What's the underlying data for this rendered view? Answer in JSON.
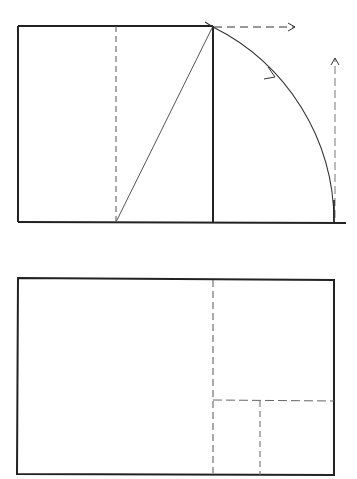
{
  "diagram": {
    "stroke_color": "#222222",
    "dash_color": "#555555",
    "top_figure": {
      "square": {
        "x1": 18,
        "y1": 26,
        "x2": 213,
        "y2": 222
      },
      "midline_x": 116,
      "arc_end_x": 334,
      "base_extends_to_x": 346
    },
    "bottom_figure": {
      "rect": {
        "x1": 18,
        "y1": 278,
        "x2": 334,
        "y2": 475
      },
      "divider_x": 213,
      "horizontal_divider_y": 400,
      "small_divider_x": 260
    }
  }
}
